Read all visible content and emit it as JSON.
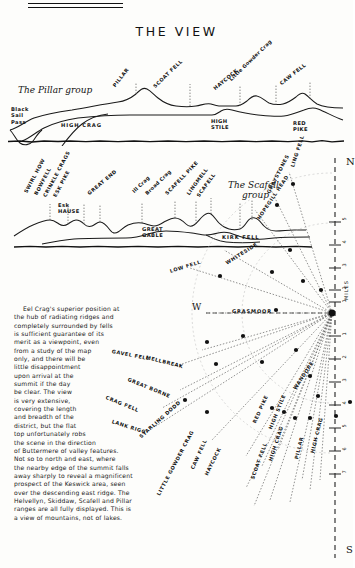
{
  "page": {
    "title": "THE VIEW",
    "background": "#fdfdfb",
    "ink": "#141414"
  },
  "panorama_top": {
    "group_caption": "The Pillar group",
    "corner_label": "Black\nSail\nPass",
    "corner_lines": [
      "Black",
      "Sail",
      "Pass"
    ],
    "peaks_upper": [
      {
        "name": "PILLAR",
        "style": "caps"
      },
      {
        "name": "SCOAT FELL",
        "style": "caps"
      },
      {
        "name": "HAYCOCK",
        "style": "caps"
      },
      {
        "name": "Little Gowder Crag",
        "style": "mixed"
      },
      {
        "name": "CAW FELL",
        "style": "caps"
      }
    ],
    "peaks_lower": [
      {
        "name": "HIGH CRAG"
      },
      {
        "name": "HIGH\nSTILE",
        "lines": [
          "HIGH",
          "STILE"
        ]
      },
      {
        "name": "RED\nPIKE",
        "lines": [
          "RED",
          "PIKE"
        ]
      }
    ]
  },
  "panorama_bottom": {
    "group_caption": "The Scafell\ngroup",
    "group_caption_lines": [
      "The Scafell",
      "group"
    ],
    "peaks_upper": [
      {
        "name": "SWIRL HOW",
        "style": "caps"
      },
      {
        "name": "BOWFELL",
        "style": "caps"
      },
      {
        "name": "CRINKLE CRAGS",
        "style": "caps"
      },
      {
        "name": "ESK PIKE",
        "style": "caps"
      },
      {
        "name": "GREAT END",
        "style": "caps"
      },
      {
        "name": "Ill Crag",
        "style": "mixed"
      },
      {
        "name": "Broad Crag",
        "style": "mixed"
      },
      {
        "name": "SCAFELL PIKE",
        "style": "caps"
      },
      {
        "name": "LINGMELL",
        "style": "caps"
      },
      {
        "name": "SCAFELL",
        "style": "caps"
      }
    ],
    "peaks_lower": [
      {
        "name": "Esk\nHAUSE",
        "lines": [
          "Esk",
          "HAUSE"
        ]
      },
      {
        "name": "GREAT\nGABLE",
        "lines": [
          "GREAT",
          "GABLE"
        ]
      },
      {
        "name": "KIRK FELL",
        "lines": [
          "KIRK FELL"
        ]
      }
    ]
  },
  "prose": {
    "lines": [
      "Eel Crag's superior position at",
      "the hub of radiating ridges and",
      "completely surrounded by fells",
      "is sufficient guarantee of its",
      "merit as a viewpoint, even",
      "from a study of the map",
      "only, and there will be",
      "little disappointment",
      "upon arrival at the",
      "summit if the day",
      "be clear. The view",
      "is very extensive,",
      "covering the length",
      "and breadth of the",
      "district, but the flat",
      "top unfortunately robs",
      "the scene in the direction",
      "of Buttermere of valley features.",
      "Not so to north and east, where",
      "the nearby edge of the summit falls",
      "away sharply to reveal a magnificent",
      "prospect of the Keswick area, seen",
      "over the descending east ridge. The",
      "Helvellyn, Skiddaw, Scafell and Pillar",
      "ranges are all fully displayed. This is",
      "a view of mountains, not of lakes."
    ]
  },
  "compass": {
    "cardinals": {
      "north": "N",
      "south": "S",
      "west": "W"
    },
    "scale_unit": "MILES",
    "scale_ticks_north": [
      "5",
      "4",
      "3",
      "2",
      "1"
    ],
    "scale_ticks_south": [
      "1",
      "2",
      "3",
      "4",
      "5",
      "6",
      "7"
    ],
    "hub_label": "GRASMOOR",
    "rays": [
      {
        "label": "LING FELL",
        "angle": -73,
        "dist": 0.78
      },
      {
        "label": "GRAYSTONES",
        "angle": -62,
        "dist": 0.63
      },
      {
        "label": "HOPEGILL HEAD",
        "angle": -55,
        "dist": 0.48
      },
      {
        "label": "WHITESIDE",
        "angle": -34,
        "dist": 0.5
      },
      {
        "label": "LOW FELL",
        "angle": -23,
        "dist": 0.72
      },
      {
        "label": "GRASMOOR",
        "angle": 0,
        "dist": 0.4
      },
      {
        "label": "MELLBREAK",
        "angle": 16,
        "dist": 0.6
      },
      {
        "label": "GAVEL FELL",
        "angle": 24,
        "dist": 0.8
      },
      {
        "label": "GREAT BORNE",
        "angle": 30,
        "dist": 0.7
      },
      {
        "label": "CRAG FELL",
        "angle": 38,
        "dist": 0.9
      },
      {
        "label": "LANK RIGG",
        "angle": 44,
        "dist": 1.0
      },
      {
        "label": "STARLING DODD",
        "angle": 48,
        "dist": 0.74
      },
      {
        "label": "RED PIKE",
        "angle": 56,
        "dist": 0.66
      },
      {
        "label": "HIGH STILE",
        "angle": 60,
        "dist": 0.6
      },
      {
        "label": "WANDOPE",
        "angle": 63,
        "dist": 0.4
      },
      {
        "label": "CAW FELL",
        "angle": 66,
        "dist": 0.82
      },
      {
        "label": "LITTLE GOWDER CRAG",
        "angle": 70,
        "dist": 0.9
      },
      {
        "label": "HAYCOCK",
        "angle": 73,
        "dist": 0.86
      },
      {
        "label": "SCOAT FELL",
        "angle": 78,
        "dist": 0.8
      },
      {
        "label": "HIGH CRAG",
        "angle": 80,
        "dist": 0.62
      },
      {
        "label": "PILLAR",
        "angle": 83,
        "dist": 0.7
      },
      {
        "label": "HIGH CRAG ",
        "angle": 86,
        "dist": 0.58
      }
    ]
  }
}
